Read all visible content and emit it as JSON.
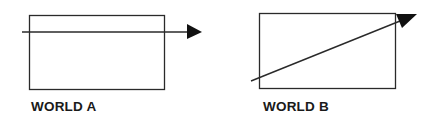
{
  "diagram": {
    "panels": [
      {
        "label": "WORLD A",
        "rect": {
          "x": 29,
          "y": 15,
          "width": 135,
          "height": 74
        },
        "arrow": {
          "x1": 22,
          "y1": 32,
          "x2": 202,
          "y2": 32,
          "direction": "horizontal"
        }
      },
      {
        "label": "WORLD B",
        "rect": {
          "x": 259,
          "y": 13,
          "width": 136,
          "height": 75
        },
        "arrow": {
          "x1": 251,
          "y1": 81,
          "x2": 417,
          "y2": 14,
          "direction": "diagonal-up-right"
        }
      }
    ],
    "colors": {
      "stroke": "#2a2a2a",
      "fill": "#111111",
      "text": "#1a1a1a",
      "background": "#ffffff"
    }
  }
}
